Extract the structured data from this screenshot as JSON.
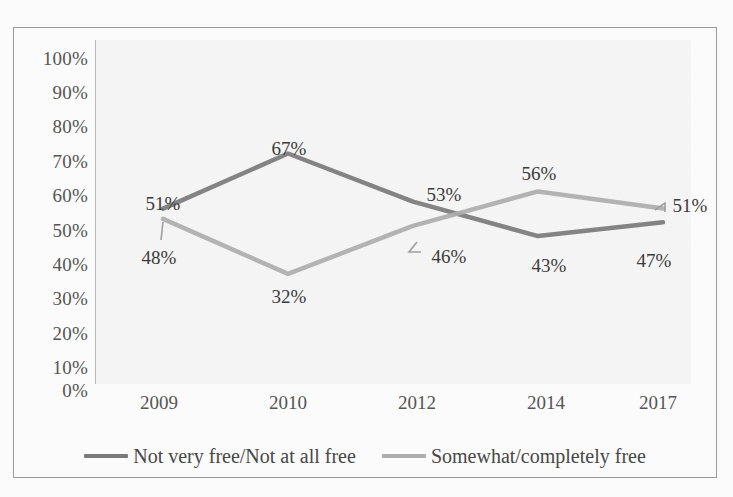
{
  "chart_data": {
    "type": "line",
    "title": "",
    "subtitle": "",
    "xlabel": "",
    "ylabel": "",
    "categories": [
      "2009",
      "2010",
      "2012",
      "2014",
      "2017"
    ],
    "series": [
      {
        "name": "Not very free/Not at all free",
        "color": "#7a7a7a",
        "values": [
          51,
          67,
          53,
          43,
          47
        ],
        "labels": [
          "51%",
          "67%",
          "53%",
          "43%",
          "47%"
        ]
      },
      {
        "name": "Somewhat/completely free",
        "color": "#adadad",
        "values": [
          48,
          32,
          46,
          56,
          51
        ],
        "labels": [
          "48%",
          "32%",
          "46%",
          "56%",
          "51%"
        ]
      }
    ],
    "ylim": [
      0,
      100
    ],
    "y_ticks": [
      100,
      90,
      80,
      70,
      60,
      50,
      40,
      30,
      20,
      10,
      0
    ],
    "y_tick_labels": [
      "100%",
      "90%",
      "80%",
      "70%",
      "60%",
      "50%",
      "40%",
      "30%",
      "20%",
      "10%",
      "0%"
    ],
    "grid": false,
    "legend_position": "bottom"
  },
  "axes": {
    "y": {
      "ticks": [
        {
          "label": "100%"
        },
        {
          "label": "90%"
        },
        {
          "label": "80%"
        },
        {
          "label": "70%"
        },
        {
          "label": "60%"
        },
        {
          "label": "50%"
        },
        {
          "label": "40%"
        },
        {
          "label": "30%"
        },
        {
          "label": "20%"
        },
        {
          "label": "10%"
        },
        {
          "label": "0%"
        }
      ]
    },
    "x": {
      "ticks": [
        {
          "label": "2009"
        },
        {
          "label": "2010"
        },
        {
          "label": "2012"
        },
        {
          "label": "2014"
        },
        {
          "label": "2017"
        }
      ]
    }
  },
  "data_labels": [
    {
      "text": "51%"
    },
    {
      "text": "67%"
    },
    {
      "text": "53%"
    },
    {
      "text": "43%"
    },
    {
      "text": "47%"
    },
    {
      "text": "48%"
    },
    {
      "text": "32%"
    },
    {
      "text": "46%"
    },
    {
      "text": "56%"
    },
    {
      "text": "51%"
    }
  ],
  "legend": {
    "items": [
      {
        "label": "Not very free/Not at all free",
        "color": "#7a7a7a"
      },
      {
        "label": "Somewhat/completely free",
        "color": "#adadad"
      }
    ]
  },
  "colors": {
    "series_dark": "#7a7a7a",
    "series_light": "#adadad",
    "frame": "#9a9a9a",
    "text": "#4a4a4a",
    "plot_background": "#f7f7f7"
  }
}
